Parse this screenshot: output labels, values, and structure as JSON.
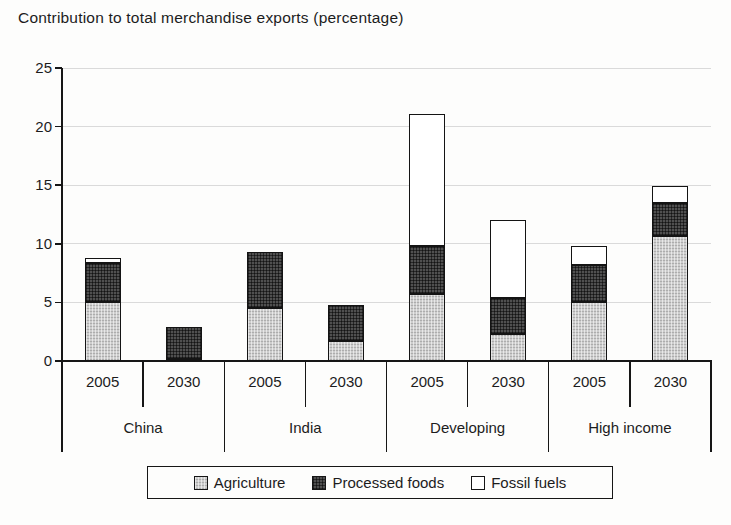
{
  "title": "Contribution to total merchandise exports (percentage)",
  "colors": {
    "agriculture": "#cdcdcd",
    "processed_foods": "#505050",
    "fossil_fuels": "#ffffff",
    "axis_line": "#161616",
    "gridline": "#dadada",
    "background": "#fdfdfc"
  },
  "chart_data": {
    "type": "bar",
    "stacked": true,
    "title": "Contribution to total merchandise exports (percentage)",
    "xlabel": "",
    "ylabel": "",
    "ylim": [
      0,
      25
    ],
    "yticks": [
      0,
      5,
      10,
      15,
      20,
      25
    ],
    "grid": true,
    "legend_position": "bottom",
    "groups": [
      "China",
      "India",
      "Developing",
      "High income"
    ],
    "years": [
      "2005",
      "2030"
    ],
    "categories": [
      "China 2005",
      "China 2030",
      "India 2005",
      "India 2030",
      "Developing 2005",
      "Developing 2030",
      "High income 2005",
      "High income 2030"
    ],
    "series": [
      {
        "name": "Agriculture",
        "values": [
          5.0,
          0.2,
          4.5,
          1.7,
          5.7,
          2.3,
          5.0,
          10.7
        ]
      },
      {
        "name": "Processed foods",
        "values": [
          3.4,
          2.7,
          4.8,
          3.1,
          4.1,
          3.1,
          3.2,
          2.8
        ]
      },
      {
        "name": "Fossil fuels",
        "values": [
          0.4,
          0.0,
          0.0,
          0.0,
          11.3,
          6.6,
          1.6,
          1.4
        ]
      }
    ],
    "stack_totals": [
      8.8,
      2.9,
      9.3,
      4.8,
      21.1,
      12.0,
      9.8,
      14.9
    ]
  }
}
